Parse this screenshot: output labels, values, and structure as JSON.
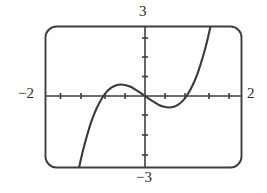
{
  "figure": {
    "type": "graphing-calculator-window",
    "frame": {
      "rounded": true,
      "stroke_color": "#3a3a3a",
      "background": "#ffffff"
    }
  },
  "labels": {
    "y_max": "3",
    "y_min": "−3",
    "x_min": "−2",
    "x_max": "2"
  },
  "chart_data": {
    "type": "line",
    "title": "",
    "xlabel": "",
    "ylabel": "",
    "xlim": [
      -2,
      2
    ],
    "ylim": [
      -3,
      3
    ],
    "xticks": [
      -2,
      -1.5,
      -1,
      -0.5,
      0,
      0.5,
      1,
      1.5,
      2
    ],
    "yticks": [
      -3,
      -2,
      -1,
      0,
      1,
      2,
      3
    ],
    "xtick_labels": [
      "−2",
      "",
      "",
      "",
      "",
      "",
      "",
      "",
      "2"
    ],
    "ytick_labels": [
      "−3",
      "",
      "",
      "",
      "",
      "",
      "3"
    ],
    "grid": false,
    "legend": "none",
    "annotations": [
      "local maximum near x = -0.6",
      "local minimum near x = 0.6",
      "curve exits bottom edge near x = -1.55",
      "curve exits top edge near x = 1.75"
    ],
    "series": [
      {
        "name": "y = 2x^3 - 1.5x",
        "color": "#3a3a3a",
        "x": [
          -1.6,
          -1.55,
          -1.5,
          -1.4,
          -1.3,
          -1.2,
          -1.1,
          -1.0,
          -0.9,
          -0.8,
          -0.7,
          -0.6,
          -0.5,
          -0.4,
          -0.3,
          -0.2,
          -0.1,
          0.0,
          0.1,
          0.2,
          0.3,
          0.4,
          0.5,
          0.6,
          0.7,
          0.8,
          0.9,
          1.0,
          1.1,
          1.2,
          1.3,
          1.4,
          1.5,
          1.6,
          1.7,
          1.75
        ],
        "y": [
          -5.79,
          -5.12,
          -4.5,
          -3.38,
          -2.44,
          -1.66,
          -1.01,
          -0.5,
          -0.11,
          0.18,
          0.36,
          0.47,
          0.5,
          0.47,
          0.4,
          0.28,
          0.15,
          0.0,
          -0.15,
          -0.28,
          -0.4,
          -0.47,
          -0.5,
          -0.47,
          -0.36,
          -0.18,
          0.11,
          0.5,
          1.01,
          1.66,
          2.44,
          3.38,
          4.5,
          5.79,
          7.28,
          8.09
        ]
      }
    ]
  }
}
